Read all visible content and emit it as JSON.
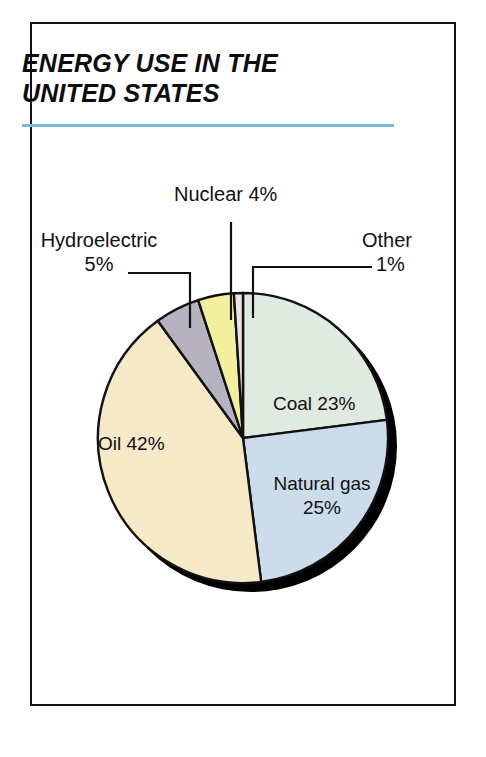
{
  "figure": {
    "title_line1": "ENERGY USE IN THE",
    "title_line2": "UNITED STATES",
    "rule_color": "#7fb8d4",
    "frame_color": "#111111",
    "background": "#ffffff"
  },
  "labels": {
    "nuclear": "Nuclear 4%",
    "hydro_line1": "Hydroelectric",
    "hydro_line2": "5%",
    "other_line1": "Other",
    "other_line2": "1%",
    "coal": "Coal 23%",
    "natgas_line1": "Natural gas",
    "natgas_line2": "25%",
    "oil": "Oil 42%"
  },
  "chart_data": {
    "type": "pie",
    "title": "ENERGY USE IN THE UNITED STATES",
    "xlabel": "",
    "ylabel": "",
    "units": "percent",
    "total": 100,
    "start_angle_deg": 0,
    "direction": "clockwise",
    "legend": "none",
    "grid": false,
    "labels_placement": "mixed-inside-and-callout",
    "categories": [
      "Coal",
      "Natural gas",
      "Oil",
      "Hydroelectric",
      "Nuclear",
      "Other"
    ],
    "values": [
      23,
      25,
      42,
      5,
      4,
      1
    ],
    "slices": [
      {
        "name": "Coal",
        "value": 23,
        "display": "Coal 23%",
        "color": "#dfeae0",
        "start_deg": 0,
        "end_deg": 82.8,
        "label_type": "inside"
      },
      {
        "name": "Natural gas",
        "value": 25,
        "display": "Natural gas 25%",
        "color": "#ccdcea",
        "start_deg": 82.8,
        "end_deg": 172.8,
        "label_type": "inside"
      },
      {
        "name": "Oil",
        "value": 42,
        "display": "Oil 42%",
        "color": "#f5e9c8",
        "start_deg": 172.8,
        "end_deg": 324.0,
        "label_type": "inside"
      },
      {
        "name": "Hydroelectric",
        "value": 5,
        "display": "Hydroelectric 5%",
        "color": "#b6b2c0",
        "start_deg": 324.0,
        "end_deg": 342.0,
        "label_type": "callout"
      },
      {
        "name": "Nuclear",
        "value": 4,
        "display": "Nuclear 4%",
        "color": "#f2ef9e",
        "start_deg": 342.0,
        "end_deg": 356.4,
        "label_type": "callout"
      },
      {
        "name": "Other",
        "value": 1,
        "display": "Other 1%",
        "color": "#ece4e4",
        "start_deg": 356.4,
        "end_deg": 360.0,
        "label_type": "callout"
      }
    ]
  }
}
